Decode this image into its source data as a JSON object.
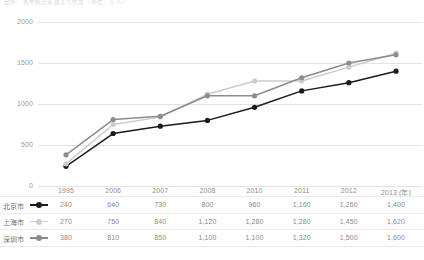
{
  "title": "出所：各市統計年鑑より作成（単位：万人）",
  "chart_data": {
    "type": "line",
    "title": "",
    "xlabel": "年",
    "ylabel": "",
    "categories": [
      "1995",
      "2006",
      "2007",
      "2008",
      "2010",
      "2011",
      "2012",
      "2013 (年)"
    ],
    "ylim": [
      0,
      2000
    ],
    "yticks": [
      "0",
      "500",
      "1000",
      "1500",
      "2000"
    ],
    "grid": true,
    "legend_position": "table-left",
    "series": [
      {
        "name": "北京市",
        "color": "#1a1a1a",
        "values": [
          240,
          640,
          730,
          800,
          960,
          1160,
          1260,
          1400
        ],
        "labels": [
          "240",
          "640",
          "730",
          "800",
          "960",
          "1,160",
          "1,260",
          "1,400"
        ]
      },
      {
        "name": "上海市",
        "color": "#cccccc",
        "values": [
          270,
          750,
          840,
          1120,
          1280,
          1280,
          1450,
          1620
        ],
        "labels": [
          "270",
          "750",
          "840",
          "1,120",
          "1,280",
          "1,280",
          "1,450",
          "1,620"
        ]
      },
      {
        "name": "深圳市",
        "color": "#8c8c8c",
        "values": [
          380,
          810,
          850,
          1100,
          1100,
          1320,
          1500,
          1600
        ],
        "labels": [
          "380",
          "810",
          "850",
          "1,100",
          "1,100",
          "1,320",
          "1,500",
          "1,600"
        ]
      }
    ]
  }
}
